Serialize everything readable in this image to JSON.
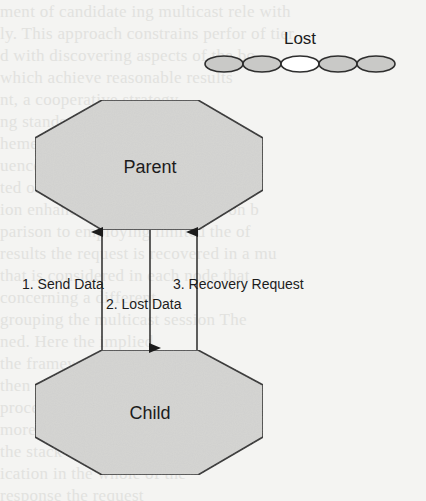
{
  "diagram": {
    "type": "network-recovery-flow",
    "colors": {
      "background": "#f4f4f2",
      "node_fill": "#d4d4d2",
      "node_stroke": "#2e2e2e",
      "line": "#1c1c1c",
      "text": "#1c1c1c",
      "bead_fill": "#c9c9c7",
      "bead_lost_fill": "#ffffff"
    },
    "nodes": [
      {
        "id": "parent",
        "label": "Parent",
        "shape": "octagon"
      },
      {
        "id": "child",
        "label": "Child",
        "shape": "octagon"
      }
    ],
    "edges": [
      {
        "id": "send",
        "label": "1. Send Data",
        "from": "child",
        "to": "parent",
        "direction": "up"
      },
      {
        "id": "lost",
        "label": "2. Lost Data",
        "from": "parent",
        "to": "child",
        "direction": "down"
      },
      {
        "id": "recovery",
        "label": "3. Recovery Request",
        "from": "child",
        "to": "parent",
        "direction": "up"
      }
    ],
    "packet_stream": {
      "label": "Lost",
      "beads": [
        {
          "state": "received"
        },
        {
          "state": "received"
        },
        {
          "state": "lost"
        },
        {
          "state": "received"
        },
        {
          "state": "received"
        }
      ]
    }
  }
}
